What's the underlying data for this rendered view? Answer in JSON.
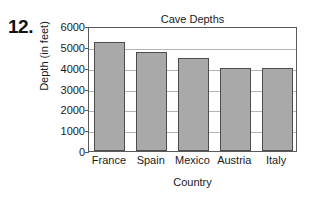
{
  "problem": {
    "number": "12."
  },
  "chart_data": {
    "type": "bar",
    "title": "Cave Depths",
    "xlabel": "Country",
    "ylabel": "Depth (in feet)",
    "categories": [
      "France",
      "Spain",
      "Mexico",
      "Austria",
      "Italy"
    ],
    "values": [
      5250,
      4750,
      4450,
      4000,
      4000
    ],
    "ylim": [
      0,
      6000
    ],
    "ytick_labels": [
      "6000",
      "5000",
      "4000",
      "3000",
      "2000",
      "1000",
      "0"
    ],
    "ytick_values": [
      6000,
      5000,
      4000,
      3000,
      2000,
      1000,
      0
    ],
    "grid": true,
    "legend": false,
    "bar_color": "#a9a9a9",
    "bar_border_color": "#4d4d4d",
    "gridline_color": "#b4b4b4",
    "axis_color": "#5a5a5a"
  }
}
